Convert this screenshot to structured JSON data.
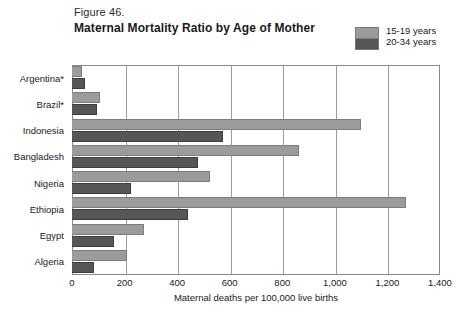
{
  "figure": {
    "number": "Figure 46.",
    "title": "Maternal Mortality Ratio by Age of Mother"
  },
  "legend": {
    "position": "top-right",
    "entries": [
      {
        "label": "15-19 years",
        "color": "#9b9b9b"
      },
      {
        "label": "20-34 years",
        "color": "#565656"
      }
    ]
  },
  "axis": {
    "x_title": "Maternal deaths per 100,000 live births",
    "ticks": [
      "0",
      "200",
      "400",
      "600",
      "800",
      "1,000",
      "1,200",
      "1,400"
    ]
  },
  "chart_data": {
    "type": "bar",
    "orientation": "horizontal",
    "title": "Maternal Mortality Ratio by Age of Mother",
    "subtitle": "Figure 46.",
    "xlabel": "Maternal deaths per 100,000 live births",
    "ylabel": "",
    "xlim": [
      0,
      1400
    ],
    "xticks": [
      0,
      200,
      400,
      600,
      800,
      1000,
      1200,
      1400
    ],
    "grid": true,
    "legend_position": "top-right",
    "categories": [
      "Argentina*",
      "Brazil*",
      "Indonesia",
      "Bangladesh",
      "Nigeria",
      "Ethiopia",
      "Egypt",
      "Algeria"
    ],
    "series": [
      {
        "name": "15-19 years",
        "color": "#9b9b9b",
        "values": [
          38,
          107,
          1100,
          865,
          525,
          1270,
          275,
          210
        ]
      },
      {
        "name": "20-34 years",
        "color": "#565656",
        "values": [
          50,
          95,
          575,
          480,
          225,
          440,
          160,
          85
        ]
      }
    ]
  }
}
